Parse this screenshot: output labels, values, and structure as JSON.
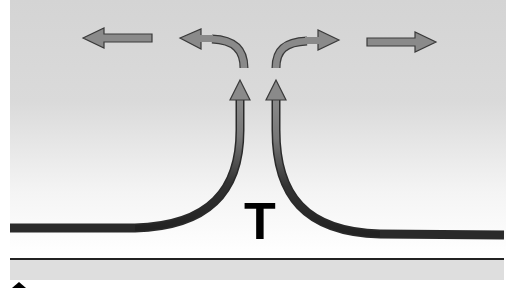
{
  "diagram": {
    "label": "T",
    "colors": {
      "arrow_fill": "#8a8a8a",
      "arrow_stroke": "#3a3a3a",
      "surface_flow": "#2a2a2a",
      "background_top": "#d4d4d4",
      "background_bottom": "#ffffff",
      "ground": "#dedede"
    },
    "arrows": [
      {
        "name": "outflow-far-left",
        "direction": "left"
      },
      {
        "name": "outflow-curved-left",
        "direction": "up-then-left"
      },
      {
        "name": "outflow-curved-right",
        "direction": "up-then-right"
      },
      {
        "name": "outflow-far-right",
        "direction": "right"
      },
      {
        "name": "rising-left",
        "direction": "up"
      },
      {
        "name": "rising-right",
        "direction": "up"
      }
    ]
  }
}
